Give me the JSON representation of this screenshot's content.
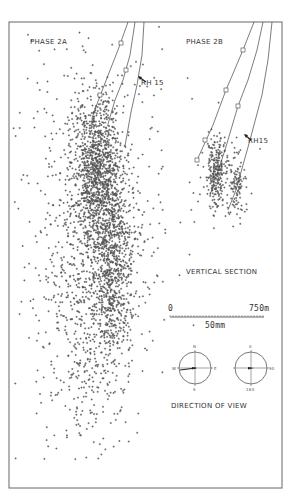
{
  "chart_data": {
    "type": "scatter",
    "title": "",
    "panels": [
      {
        "label": "PHASE 2A",
        "well_label": "RH 15",
        "trajectories": [
          {
            "points": [
              [
                128,
                22
              ],
              [
                118,
                50
              ],
              [
                107,
                78
              ],
              [
                97,
                104
              ],
              [
                92,
                118
              ]
            ],
            "markers": [
              [
                121,
                43
              ],
              [
                100,
                95
              ]
            ]
          },
          {
            "points": [
              [
                135,
                22
              ],
              [
                130,
                55
              ],
              [
                123,
                80
              ],
              [
                115,
                100
              ],
              [
                108,
                124
              ]
            ],
            "markers": [
              [
                126,
                70
              ]
            ]
          },
          {
            "points": [
              [
                144,
                22
              ],
              [
                142,
                55
              ],
              [
                137,
                85
              ],
              [
                131,
                112
              ],
              [
                125,
                146
              ]
            ],
            "markers": []
          }
        ],
        "clusters": [
          {
            "cx": 95,
            "cy": 165,
            "sx": 12,
            "sy": 35,
            "n": 900
          },
          {
            "cx": 112,
            "cy": 250,
            "sx": 10,
            "sy": 55,
            "n": 800
          },
          {
            "cx": 90,
            "cy": 290,
            "sx": 22,
            "sy": 80,
            "n": 700
          },
          {
            "cx": 95,
            "cy": 230,
            "sx": 40,
            "sy": 110,
            "n": 450
          }
        ]
      },
      {
        "label": "PHASE 2B",
        "well_label": "RH15",
        "trajectories": [
          {
            "points": [
              [
                254,
                22
              ],
              [
                243,
                50
              ],
              [
                226,
                90
              ],
              [
                213,
                125
              ],
              [
                198,
                158
              ]
            ],
            "markers": [
              [
                243,
                50
              ],
              [
                226,
                90
              ],
              [
                205,
                140
              ],
              [
                197,
                160
              ]
            ]
          },
          {
            "points": [
              [
                263,
                22
              ],
              [
                257,
                50
              ],
              [
                248,
                80
              ],
              [
                238,
                106
              ],
              [
                225,
                150
              ],
              [
                210,
                195
              ]
            ],
            "markers": [
              [
                238,
                106
              ]
            ]
          },
          {
            "points": [
              [
                272,
                22
              ],
              [
                268,
                60
              ],
              [
                262,
                95
              ],
              [
                250,
                140
              ],
              [
                236,
                190
              ],
              [
                228,
                210
              ]
            ],
            "markers": []
          }
        ],
        "clusters": [
          {
            "cx": 216,
            "cy": 172,
            "sx": 5,
            "sy": 17,
            "n": 220
          },
          {
            "cx": 237,
            "cy": 185,
            "sx": 4,
            "sy": 14,
            "n": 90
          },
          {
            "cx": 222,
            "cy": 170,
            "sx": 14,
            "sy": 28,
            "n": 60
          }
        ]
      }
    ],
    "section_label": "VERTICAL SECTION",
    "scale_bar": {
      "start": "0",
      "end": "750m",
      "caption": "50mm"
    },
    "direction_of_view": {
      "label": "DIRECTION OF VIEW",
      "compass_left": {
        "top": "N",
        "right": "E",
        "bottom": "S",
        "left": "W"
      },
      "compass_right": {
        "top": "0",
        "right": "90",
        "bottom": "180"
      }
    },
    "xlabel": "",
    "ylabel": "",
    "grid": false,
    "legend": null
  },
  "labels": {
    "phase_2a": "PHASE 2A",
    "phase_2b": "PHASE 2B",
    "rh15_a": "RH 15",
    "rh15_b": "RH15",
    "vertical_section": "VERTICAL SECTION",
    "scale_start": "0",
    "scale_end": "750m",
    "scale_caption": "50mm",
    "direction_of_view": "DIRECTION OF VIEW",
    "compass_n": "N",
    "compass_e": "E",
    "compass_s": "S",
    "compass_w": "W",
    "compass_0": "0",
    "compass_90": "90",
    "compass_180": "180"
  },
  "colors": {
    "ink": "#2a2a2a",
    "frame": "#555555",
    "background": "#ffffff"
  }
}
